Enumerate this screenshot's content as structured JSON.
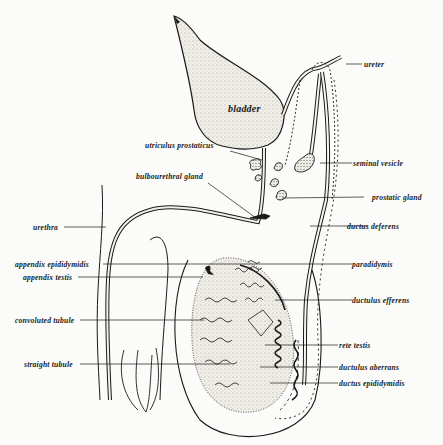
{
  "diagram": {
    "colors": {
      "ink": "#1a1a1a",
      "paper": "#fbfbf9",
      "stipple": "#d9d6cc"
    },
    "structures": {
      "bladder": "bladder"
    },
    "labels_left": [
      {
        "id": "utriculus-prostaticus",
        "text": "utriculus prostaticus"
      },
      {
        "id": "bulbourethral-gland",
        "text": "bulbourethral gland"
      },
      {
        "id": "urethra",
        "text": "urethra"
      },
      {
        "id": "appendix-epididymidis",
        "text": "appendix epididymidis"
      },
      {
        "id": "appendix-testis",
        "text": "appendix testis"
      },
      {
        "id": "convoluted-tubule",
        "text": "convoluted tubule"
      },
      {
        "id": "straight-tubule",
        "text": "straight tubule"
      }
    ],
    "labels_right": [
      {
        "id": "ureter",
        "text": "ureter"
      },
      {
        "id": "seminal-vesicle",
        "text": "seminal vesicle"
      },
      {
        "id": "prostatic-gland",
        "text": "prostatic gland"
      },
      {
        "id": "ductus-deferens",
        "text": "ductus deferens"
      },
      {
        "id": "paradidymis",
        "text": "paradidymis"
      },
      {
        "id": "ductulus-efferens",
        "text": "ductulus efferens"
      },
      {
        "id": "rete-testis",
        "text": "rete testis"
      },
      {
        "id": "ductulus-aberrans",
        "text": "ductulus aberrans"
      },
      {
        "id": "ductus-epididymidis",
        "text": "ductus epididymidis"
      }
    ]
  }
}
